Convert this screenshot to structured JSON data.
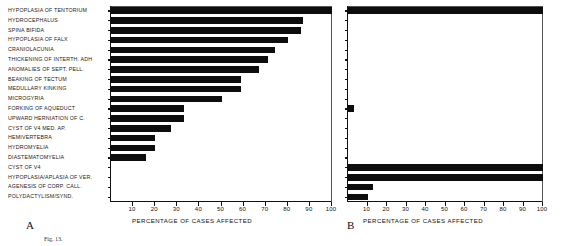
{
  "figure": {
    "caption_fragment": "Fig. 13.",
    "panels": [
      {
        "letter": "A",
        "x": 26,
        "y": 224
      },
      {
        "letter": "B",
        "x": 347,
        "y": 224
      }
    ]
  },
  "axis": {
    "title": "PERCENTAGE OF CASES AFFECTED",
    "ticks": [
      10,
      20,
      30,
      40,
      50,
      60,
      70,
      80,
      90,
      100
    ],
    "tick_labels": [
      "10",
      "20",
      "30",
      "40",
      "50",
      "60",
      "70",
      "80",
      "90",
      "100"
    ],
    "min": 0,
    "max": 100
  },
  "categories": [
    "HYPOPLASIA OF TENTORIUM",
    "HYDROCEPHALUS",
    "SPINA BIFIDA",
    "HYPOPLASIA OF FALX",
    "CRANIOLACUNIA",
    "THICKENING OF INTERTH. ADH",
    "ANOMALIES OF SEPT. PELL.",
    "BEAKING OF TECTUM",
    "MEDULLARY KINKING",
    "MICROGYRIA",
    "FORKING OF AQUEDUCT",
    "UPWARD HERNIATION OF C.",
    "CYST OF V4 MED. AP.",
    "HEMIVERTEBRA",
    "HYDROMYELIA",
    "DIASTEMATOMYELIA",
    "CYST OF V4",
    "HYPOPLASIA/APLASIA OF VER.",
    "AGENESIS OF CORP. CALL.",
    "POLYDACTYLISM/SYND."
  ],
  "chart_data": {
    "type": "bar",
    "orientation": "horizontal",
    "title": "",
    "xlabel": "PERCENTAGE OF CASES AFFECTED",
    "ylabel": "",
    "xlim": [
      0,
      100
    ],
    "grid": false,
    "legend": "none",
    "categories": [
      "HYPOPLASIA OF TENTORIUM",
      "HYDROCEPHALUS",
      "SPINA BIFIDA",
      "HYPOPLASIA OF FALX",
      "CRANIOLACUNIA",
      "THICKENING OF INTERTH. ADH",
      "ANOMALIES OF SEPT. PELL.",
      "BEAKING OF TECTUM",
      "MEDULLARY KINKING",
      "MICROGYRIA",
      "FORKING OF AQUEDUCT",
      "UPWARD HERNIATION OF C.",
      "CYST OF V4 MED. AP.",
      "HEMIVERTEBRA",
      "HYDROMYELIA",
      "DIASTEMATOMYELIA",
      "CYST OF V4",
      "HYPOPLASIA/APLASIA OF VER.",
      "AGENESIS OF CORP. CALL.",
      "POLYDACTYLISM/SYND."
    ],
    "series": [
      {
        "name": "A",
        "panel": "A",
        "values": [
          100,
          87,
          86,
          80,
          74,
          71,
          67,
          59,
          59,
          50,
          33,
          33,
          27,
          20,
          20,
          16,
          0,
          0,
          0,
          0
        ]
      },
      {
        "name": "B",
        "panel": "B",
        "values": [
          100,
          0,
          0,
          0,
          0,
          0,
          0,
          0,
          0,
          0,
          3,
          0,
          0,
          0,
          0,
          0,
          100,
          100,
          13,
          10
        ]
      }
    ],
    "bar_color": "#0d0d0d"
  }
}
